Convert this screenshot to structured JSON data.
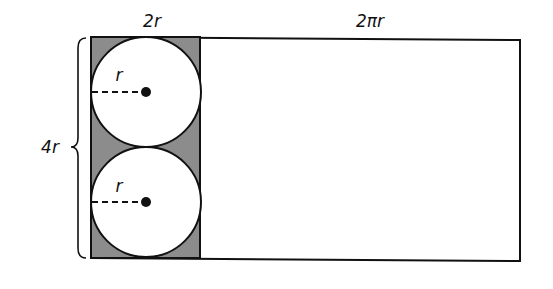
{
  "diagram": {
    "title": "",
    "labels": {
      "shaded_width": "2r",
      "rectangle_width": "2πr",
      "height": "4r",
      "top_radius": "r",
      "bottom_radius": "r"
    },
    "shapes": {
      "shaded_rectangle": {
        "x": 91,
        "y": 37,
        "width": 109,
        "height": 221,
        "fill": "#8c8c8c"
      },
      "large_rectangle": {
        "x": 91,
        "y": 37,
        "right": 520,
        "bottom": 261
      },
      "circles": [
        {
          "cx": 146,
          "cy": 92,
          "r": 55
        },
        {
          "cx": 146,
          "cy": 202,
          "r": 55
        }
      ]
    },
    "colors": {
      "stroke": "#111111",
      "shade": "#8c8c8c",
      "circle_fill": "#ffffff",
      "background": "#ffffff"
    }
  }
}
